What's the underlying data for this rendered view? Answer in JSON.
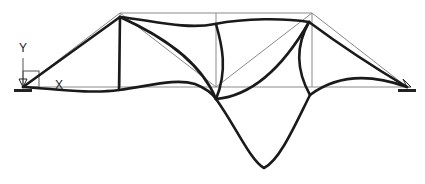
{
  "diagram": {
    "type": "truss-mode-shape",
    "axis_labels": {
      "y": "Y",
      "x": "X"
    },
    "colors": {
      "undeformed": "#8a8a8a",
      "deformed": "#1a1a1a",
      "support": "#222222"
    },
    "supports": [
      {
        "name": "left-pin-support",
        "x": 23,
        "y": 87
      },
      {
        "name": "right-pin-support",
        "x": 407,
        "y": 87
      }
    ]
  }
}
